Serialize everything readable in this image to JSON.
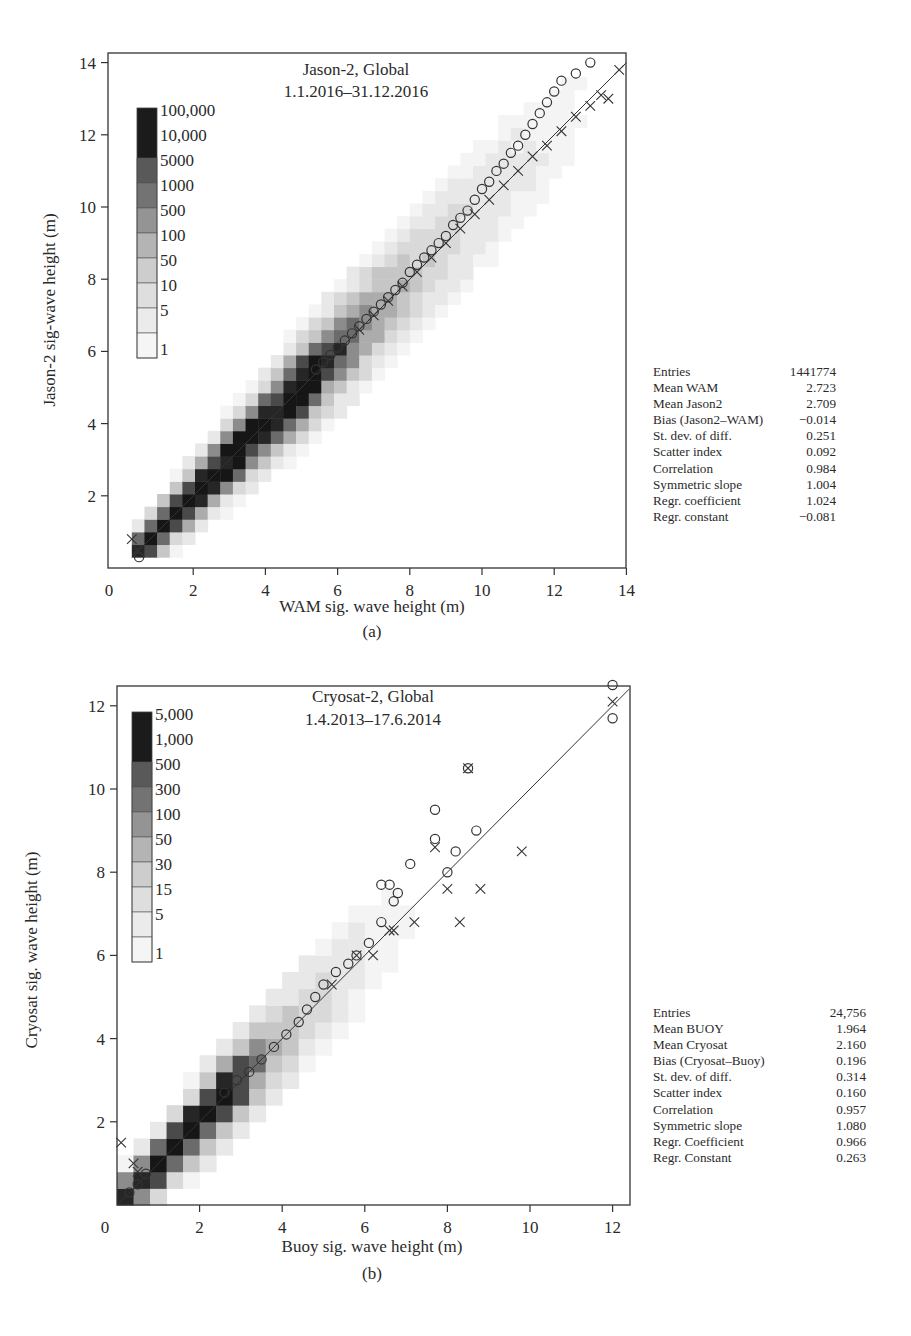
{
  "chart_data": [
    {
      "panel": "(a)",
      "type": "heatmap",
      "title": "Jason-2, Global",
      "subtitle": "1.1.2016–31.12.2016",
      "xlabel": "WAM sig. wave height (m)",
      "ylabel": "Jason-2 sig-wave height (m)",
      "xlim": [
        0,
        14
      ],
      "ylim": [
        0,
        14
      ],
      "xticks": [
        "0",
        "2",
        "4",
        "6",
        "8",
        "10",
        "12",
        "14"
      ],
      "yticks": [
        "0",
        "2",
        "4",
        "6",
        "8",
        "10",
        "12",
        "14"
      ],
      "grid": false,
      "legend_position": "upper-left",
      "colorbar": {
        "labels": [
          "100,000",
          "10,000",
          "5000",
          "1000",
          "500",
          "100",
          "50",
          "10",
          "5",
          "1"
        ],
        "colors": [
          "#1a1a1a",
          "#1a1a1a",
          "#555555",
          "#6a6a6a",
          "#8a8a8a",
          "#aaaaaa",
          "#c3c3c3",
          "#d6d6d6",
          "#e6e6e6",
          "#f2f2f2"
        ]
      },
      "reference_line": "y = x",
      "series": [
        {
          "name": "quantiles (Jason-2 vs WAM) circles",
          "marker": "o",
          "x": [
            0.5,
            5.4,
            5.6,
            5.8,
            6.0,
            6.2,
            6.4,
            6.6,
            6.8,
            7.0,
            7.2,
            7.4,
            7.6,
            7.8,
            8.0,
            8.2,
            8.4,
            8.6,
            8.8,
            9.0,
            9.2,
            9.4,
            9.6,
            9.8,
            10.0,
            10.2,
            10.4,
            10.6,
            10.8,
            11.0,
            11.2,
            11.4,
            11.6,
            11.8,
            12.0,
            12.2,
            12.6,
            13.0
          ],
          "y": [
            0.3,
            5.5,
            5.7,
            5.9,
            6.1,
            6.3,
            6.5,
            6.7,
            6.9,
            7.1,
            7.3,
            7.5,
            7.7,
            7.9,
            8.2,
            8.4,
            8.6,
            8.8,
            9.0,
            9.2,
            9.5,
            9.7,
            9.9,
            10.2,
            10.5,
            10.7,
            11.0,
            11.2,
            11.5,
            11.7,
            12.0,
            12.3,
            12.6,
            12.9,
            13.2,
            13.5,
            13.7,
            14.0
          ]
        },
        {
          "name": "quantiles (WAM vs Jason-2) crosses",
          "marker": "x",
          "x": [
            0.3,
            0.45,
            6.6,
            7.0,
            7.4,
            7.8,
            8.2,
            8.6,
            9.0,
            9.4,
            9.8,
            10.2,
            10.6,
            11.0,
            11.4,
            11.8,
            12.2,
            12.6,
            13.0,
            13.3,
            13.5,
            13.8
          ],
          "y": [
            0.8,
            0.5,
            6.6,
            7.0,
            7.4,
            7.8,
            8.2,
            8.6,
            9.0,
            9.4,
            9.8,
            10.2,
            10.6,
            11.0,
            11.4,
            11.7,
            12.1,
            12.5,
            12.8,
            13.1,
            13.0,
            13.8
          ]
        }
      ],
      "statistics": [
        {
          "label": "Entries",
          "value": "1441774"
        },
        {
          "label": "Mean WAM",
          "value": "2.723"
        },
        {
          "label": "Mean Jason2",
          "value": "2.709"
        },
        {
          "label": "Bias (Jason2–WAM)",
          "value": "−0.014"
        },
        {
          "label": "St. dev. of diff.",
          "value": "0.251"
        },
        {
          "label": "Scatter index",
          "value": "0.092"
        },
        {
          "label": "Correlation",
          "value": "0.984"
        },
        {
          "label": "Symmetric slope",
          "value": "1.004"
        },
        {
          "label": "Regr. coefficient",
          "value": "1.024"
        },
        {
          "label": "Regr. constant",
          "value": "−0.081"
        }
      ]
    },
    {
      "panel": "(b)",
      "type": "heatmap",
      "title": "Cryosat-2, Global",
      "subtitle": "1.4.2013–17.6.2014",
      "xlabel": "Buoy sig. wave height (m)",
      "ylabel": "Cryosat sig. wave height (m)",
      "xlim": [
        0,
        12.5
      ],
      "ylim": [
        0,
        12.5
      ],
      "xticks": [
        "0",
        "2",
        "4",
        "6",
        "8",
        "10",
        "12"
      ],
      "yticks": [
        "2",
        "4",
        "6",
        "8",
        "10",
        "12"
      ],
      "grid": false,
      "legend_position": "upper-left",
      "colorbar": {
        "labels": [
          "5,000",
          "1,000",
          "500",
          "300",
          "100",
          "50",
          "30",
          "15",
          "5",
          "1"
        ],
        "colors": [
          "#1a1a1a",
          "#1a1a1a",
          "#555555",
          "#6a6a6a",
          "#8a8a8a",
          "#aaaaaa",
          "#c3c3c3",
          "#d6d6d6",
          "#e6e6e6",
          "#f2f2f2"
        ]
      },
      "reference_line": "y = x",
      "series": [
        {
          "name": "quantiles circles",
          "marker": "o",
          "x": [
            0.3,
            0.5,
            0.7,
            2.6,
            2.9,
            3.2,
            3.5,
            3.8,
            4.1,
            4.4,
            4.6,
            4.8,
            5.0,
            5.3,
            5.6,
            5.8,
            6.1,
            6.4,
            6.7,
            6.8,
            6.6,
            6.4,
            7.1,
            7.7,
            7.7,
            8.0,
            8.2,
            8.5,
            8.7,
            12.0,
            12.0
          ],
          "y": [
            0.3,
            0.5,
            0.75,
            2.7,
            3.0,
            3.2,
            3.5,
            3.8,
            4.1,
            4.4,
            4.7,
            5.0,
            5.3,
            5.6,
            5.8,
            6.0,
            6.3,
            6.8,
            7.3,
            7.5,
            7.7,
            7.7,
            8.2,
            8.8,
            9.5,
            8.0,
            8.5,
            10.5,
            9.0,
            12.5,
            11.7
          ]
        },
        {
          "name": "quantiles crosses",
          "marker": "x",
          "x": [
            0.1,
            0.4,
            0.5,
            5.2,
            5.8,
            6.2,
            6.6,
            6.7,
            7.2,
            7.7,
            8.0,
            8.3,
            8.5,
            8.8,
            9.8,
            12.0
          ],
          "y": [
            1.5,
            1.0,
            0.8,
            5.3,
            6.0,
            6.0,
            6.6,
            6.6,
            6.8,
            8.6,
            7.6,
            6.8,
            10.5,
            7.6,
            8.5,
            12.1
          ]
        }
      ],
      "statistics": [
        {
          "label": "Entries",
          "value": "24,756"
        },
        {
          "label": "Mean BUOY",
          "value": "1.964"
        },
        {
          "label": "Mean Cryosat",
          "value": "2.160"
        },
        {
          "label": "Bias (Cryosat–Buoy)",
          "value": "0.196"
        },
        {
          "label": "St. dev. of diff.",
          "value": "0.314"
        },
        {
          "label": "Scatter index",
          "value": "0.160"
        },
        {
          "label": "Correlation",
          "value": "0.957"
        },
        {
          "label": "Symmetric slope",
          "value": "1.080"
        },
        {
          "label": "Regr. Coefficient",
          "value": "0.966"
        },
        {
          "label": "Regr. Constant",
          "value": "0.263"
        }
      ]
    }
  ],
  "panels": {
    "a": {
      "caption": "(a)",
      "title": "Jason-2, Global",
      "subtitle": "1.1.2016–31.12.2016",
      "xlabel": "WAM sig. wave height (m)",
      "ylabel": "Jason-2 sig-wave height (m)"
    },
    "b": {
      "caption": "(b)",
      "title": "Cryosat-2, Global",
      "subtitle": "1.4.2013–17.6.2014",
      "xlabel": "Buoy sig. wave height (m)",
      "ylabel": "Cryosat sig. wave height (m)"
    }
  }
}
